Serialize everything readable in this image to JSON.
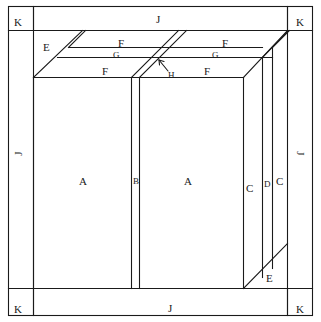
{
  "diagram": {
    "style": {
      "stroke": "#1a1a1a",
      "background": "#ffffff",
      "text": "#1a1a1a"
    },
    "labels": [
      {
        "id": "k-top-left",
        "text": "K",
        "x": 14,
        "y": 17,
        "rotate": "none",
        "size": "normal"
      },
      {
        "id": "j-top",
        "text": "J",
        "x": 156,
        "y": 14,
        "rotate": "none",
        "size": "normal"
      },
      {
        "id": "k-top-right",
        "text": "K",
        "x": 296,
        "y": 17,
        "rotate": "none",
        "size": "normal"
      },
      {
        "id": "e-top-left",
        "text": "E",
        "x": 43,
        "y": 42,
        "rotate": "none",
        "size": "normal"
      },
      {
        "id": "f-top-left",
        "text": "F",
        "x": 118,
        "y": 38,
        "rotate": "none",
        "size": "normal"
      },
      {
        "id": "g-left",
        "text": "G",
        "x": 113,
        "y": 51,
        "rotate": "none",
        "size": "small"
      },
      {
        "id": "f-mid-left",
        "text": "F",
        "x": 102,
        "y": 66,
        "rotate": "none",
        "size": "normal"
      },
      {
        "id": "f-top-right",
        "text": "F",
        "x": 222,
        "y": 38,
        "rotate": "none",
        "size": "normal"
      },
      {
        "id": "g-right",
        "text": "G",
        "x": 212,
        "y": 51,
        "rotate": "none",
        "size": "small"
      },
      {
        "id": "f-mid-right",
        "text": "F",
        "x": 204,
        "y": 66,
        "rotate": "none",
        "size": "normal"
      },
      {
        "id": "h-pointer",
        "text": "H",
        "x": 168,
        "y": 71,
        "rotate": "none",
        "size": "small"
      },
      {
        "id": "j-left",
        "text": "J",
        "x": 14,
        "y": 148,
        "rotate": "left",
        "size": "normal"
      },
      {
        "id": "a-left-panel",
        "text": "A",
        "x": 79,
        "y": 176,
        "rotate": "none",
        "size": "normal"
      },
      {
        "id": "b-divider",
        "text": "B",
        "x": 133,
        "y": 177,
        "rotate": "none",
        "size": "small"
      },
      {
        "id": "a-right-panel",
        "text": "A",
        "x": 184,
        "y": 176,
        "rotate": "none",
        "size": "normal"
      },
      {
        "id": "c-inner",
        "text": "C",
        "x": 246,
        "y": 183,
        "rotate": "none",
        "size": "normal"
      },
      {
        "id": "d-slot",
        "text": "D",
        "x": 264,
        "y": 180,
        "rotate": "none",
        "size": "small"
      },
      {
        "id": "c-outer",
        "text": "C",
        "x": 276,
        "y": 176,
        "rotate": "none",
        "size": "normal"
      },
      {
        "id": "j-right",
        "text": "J",
        "x": 299,
        "y": 148,
        "rotate": "right",
        "size": "normal"
      },
      {
        "id": "e-bottom-right",
        "text": "E",
        "x": 266,
        "y": 273,
        "rotate": "none",
        "size": "normal"
      },
      {
        "id": "k-bottom-left",
        "text": "K",
        "x": 14,
        "y": 304,
        "rotate": "none",
        "size": "normal"
      },
      {
        "id": "j-bottom",
        "text": "J",
        "x": 168,
        "y": 303,
        "rotate": "none",
        "size": "normal"
      },
      {
        "id": "k-bottom-right",
        "text": "K",
        "x": 296,
        "y": 304,
        "rotate": "none",
        "size": "normal"
      }
    ],
    "geometry": {
      "outer_frame": {
        "x": 8,
        "y": 6,
        "width": 305,
        "height": 310
      },
      "top_band_y": 30,
      "bottom_band_y": 288,
      "left_band_x": 33,
      "right_band_x": 288,
      "cabinet_face": {
        "left": 33,
        "right": 288,
        "top": 77,
        "bottom": 288
      },
      "door_divider_x": [
        131,
        139
      ],
      "right_panel_x": [
        243,
        262,
        272,
        287
      ],
      "top_deck_lines_y": [
        30,
        47,
        57,
        77
      ]
    }
  }
}
